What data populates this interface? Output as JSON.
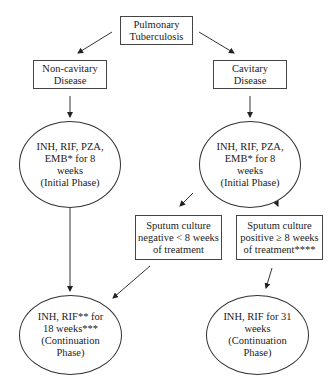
{
  "diagram": {
    "type": "flowchart",
    "nodes": {
      "root": {
        "text": "Pulmonary\nTuberculosis",
        "shape": "box"
      },
      "noncavitary": {
        "text": "Non-cavitary\nDisease",
        "shape": "box"
      },
      "cavitary": {
        "text": "Cavitary\nDisease",
        "shape": "box"
      },
      "initial_left": {
        "text": "INH, RIF, PZA,\nEMB* for 8\nweeks\n(Initial Phase)",
        "shape": "oval"
      },
      "initial_right": {
        "text": "INH, RIF, PZA,\nEMB* for 8\nweeks\n(Initial Phase)",
        "shape": "oval"
      },
      "sputum_negative": {
        "text": "Sputum culture\nnegative < 8 weeks\nof treatment",
        "shape": "box"
      },
      "sputum_positive": {
        "text": "Sputum culture\npositive ≥ 8 weeks\nof treatment****",
        "shape": "box"
      },
      "continuation_18": {
        "text": "INH, RIF** for\n18 weeks***\n(Continuation\nPhase)",
        "shape": "oval"
      },
      "continuation_31": {
        "text": "INH, RIF for 31\nweeks\n(Continuation\nPhase)",
        "shape": "oval"
      }
    },
    "edges": [
      {
        "from": "root",
        "to": "noncavitary"
      },
      {
        "from": "root",
        "to": "cavitary"
      },
      {
        "from": "noncavitary",
        "to": "initial_left"
      },
      {
        "from": "cavitary",
        "to": "initial_right"
      },
      {
        "from": "initial_right",
        "to": "sputum_negative"
      },
      {
        "from": "initial_right",
        "to": "sputum_positive"
      },
      {
        "from": "initial_left",
        "to": "continuation_18"
      },
      {
        "from": "sputum_negative",
        "to": "continuation_18"
      },
      {
        "from": "sputum_positive",
        "to": "continuation_31"
      }
    ]
  }
}
